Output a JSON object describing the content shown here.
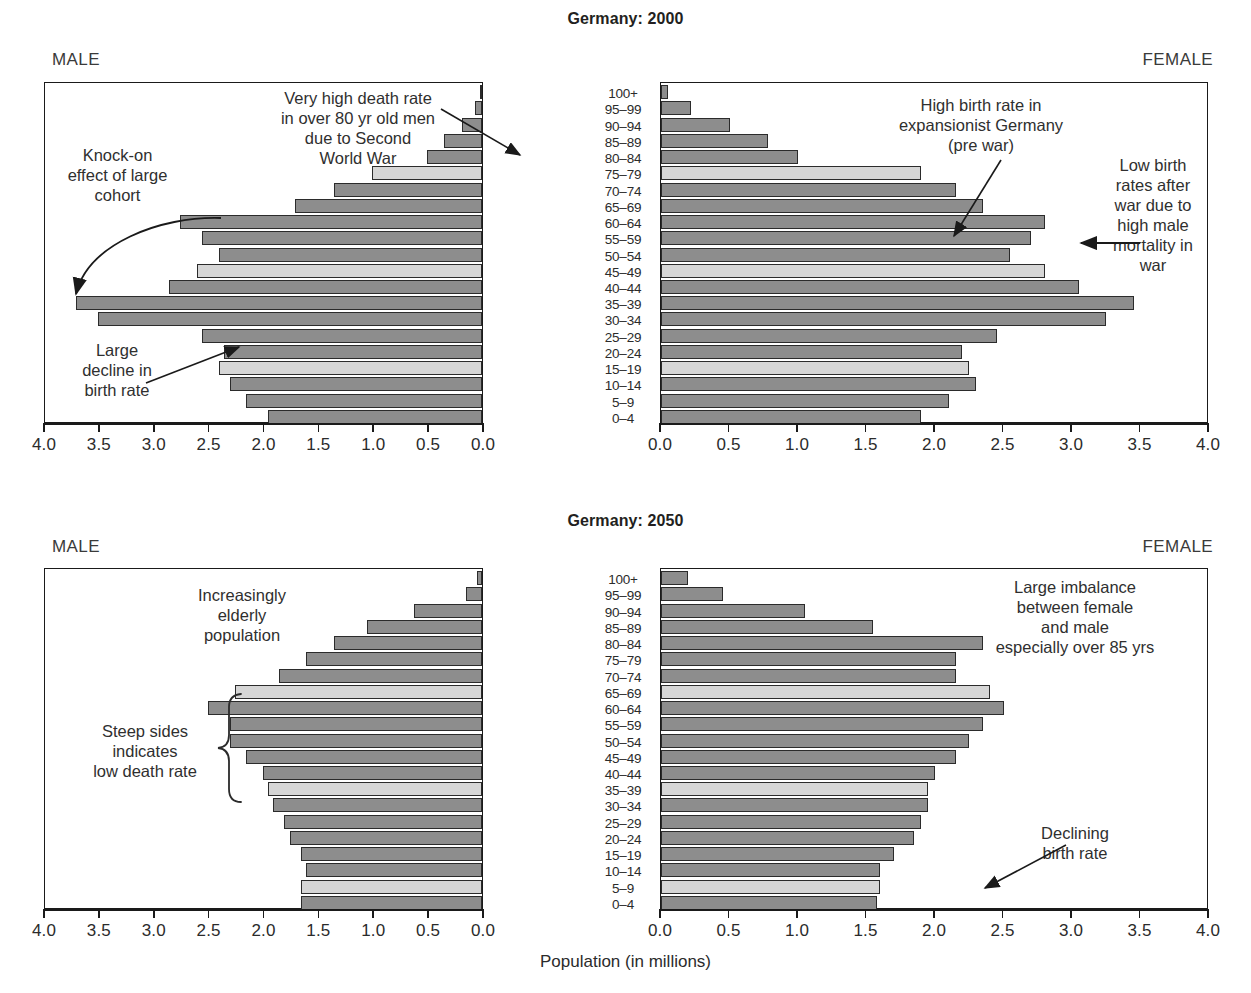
{
  "axis_title": "Population (in millions)",
  "side_labels": {
    "male": "MALE",
    "female": "FEMALE"
  },
  "tick_labels_male": [
    "4.0",
    "3.5",
    "3.0",
    "2.5",
    "2.0",
    "1.5",
    "1.0",
    "0.5",
    "0.0"
  ],
  "tick_labels_female": [
    "0.0",
    "0.5",
    "1.0",
    "1.5",
    "2.0",
    "2.5",
    "3.0",
    "3.5",
    "4.0"
  ],
  "age_groups": [
    "100+",
    "95–99",
    "90–94",
    "85–89",
    "80–84",
    "75–79",
    "70–74",
    "65–69",
    "60–64",
    "55–59",
    "50–54",
    "45–49",
    "40–44",
    "35–39",
    "30–34",
    "25–29",
    "20–24",
    "15–19",
    "10–14",
    "5–9",
    "0–4"
  ],
  "colors": {
    "bar_dark": "#8d8d8d",
    "bar_light": "#d6d6d6",
    "outline": "#2b2b2b",
    "text": "#2f2f2f"
  },
  "panels": [
    {
      "id": "2000",
      "title": "Germany: 2000",
      "annotations": [
        {
          "name": "very-high-death-rate",
          "text": "Very high death rate\nin over 80 yr old men\ndue to Second\nWorld War"
        },
        {
          "name": "knock-on-effect",
          "text": "Knock-on\neffect of large\ncohort"
        },
        {
          "name": "large-decline-birth-rate",
          "text": "Large\ndecline in\nbirth rate"
        },
        {
          "name": "high-birth-rate-expansionist",
          "text": "High birth rate in\nexpansionist Germany\n(pre war)"
        },
        {
          "name": "low-birth-rates-after-war",
          "text": "Low birth\nrates after\nwar due to\nhigh male\nmortality in\nwar"
        }
      ]
    },
    {
      "id": "2050",
      "title": "Germany: 2050",
      "annotations": [
        {
          "name": "increasingly-elderly",
          "text": "Increasingly\nelderly\npopulation"
        },
        {
          "name": "steep-sides",
          "text": "Steep sides\nindicates\nlow death rate"
        },
        {
          "name": "large-imbalance",
          "text": "Large imbalance\nbetween female\nand male\nespecially over 85 yrs"
        },
        {
          "name": "declining-birth-rate",
          "text": "Declining\nbirth rate"
        }
      ]
    }
  ],
  "chart_data": [
    {
      "type": "bar",
      "title": "Germany: 2000",
      "subtype": "population-pyramid",
      "xlabel": "Population (in millions)",
      "ylabel": "Age group",
      "xlim": [
        0,
        4.0
      ],
      "xticks": [
        0.0,
        0.5,
        1.0,
        1.5,
        2.0,
        2.5,
        3.0,
        3.5,
        4.0
      ],
      "grid": false,
      "legend": "none",
      "categories": [
        "100+",
        "95–99",
        "90–94",
        "85–89",
        "80–84",
        "75–79",
        "70–74",
        "65–69",
        "60–64",
        "55–59",
        "50–54",
        "45–49",
        "40–44",
        "35–39",
        "30–34",
        "25–29",
        "20–24",
        "15–19",
        "10–14",
        "5–9",
        "0–4"
      ],
      "series": [
        {
          "name": "MALE",
          "direction": "left",
          "values": [
            0.02,
            0.06,
            0.18,
            0.35,
            0.5,
            1.0,
            1.35,
            1.7,
            2.75,
            2.55,
            2.4,
            2.6,
            2.85,
            3.7,
            3.5,
            2.55,
            2.35,
            2.4,
            2.3,
            2.15,
            1.95
          ]
        },
        {
          "name": "FEMALE",
          "direction": "right",
          "values": [
            0.05,
            0.22,
            0.5,
            0.78,
            1.0,
            1.9,
            2.15,
            2.35,
            2.8,
            2.7,
            2.55,
            2.8,
            3.05,
            3.45,
            3.25,
            2.45,
            2.2,
            2.25,
            2.3,
            2.1,
            1.9
          ]
        }
      ]
    },
    {
      "type": "bar",
      "title": "Germany: 2050",
      "subtype": "population-pyramid",
      "xlabel": "Population (in millions)",
      "ylabel": "Age group",
      "xlim": [
        0,
        4.0
      ],
      "xticks": [
        0.0,
        0.5,
        1.0,
        1.5,
        2.0,
        2.5,
        3.0,
        3.5,
        4.0
      ],
      "grid": false,
      "legend": "none",
      "categories": [
        "100+",
        "95–99",
        "90–94",
        "85–89",
        "80–84",
        "75–79",
        "70–74",
        "65–69",
        "60–64",
        "55–59",
        "50–54",
        "45–49",
        "40–44",
        "35–39",
        "30–34",
        "25–29",
        "20–24",
        "15–19",
        "10–14",
        "5–9",
        "0–4"
      ],
      "series": [
        {
          "name": "MALE",
          "direction": "left",
          "values": [
            0.05,
            0.15,
            0.62,
            1.05,
            1.35,
            1.6,
            1.85,
            2.25,
            2.5,
            2.3,
            2.3,
            2.15,
            2.0,
            1.95,
            1.9,
            1.8,
            1.75,
            1.65,
            1.6,
            1.65,
            1.65
          ]
        },
        {
          "name": "FEMALE",
          "direction": "right",
          "values": [
            0.2,
            0.45,
            1.05,
            1.55,
            2.35,
            2.15,
            2.15,
            2.4,
            2.5,
            2.35,
            2.25,
            2.15,
            2.0,
            1.95,
            1.95,
            1.9,
            1.85,
            1.7,
            1.6,
            1.6,
            1.58
          ]
        }
      ]
    }
  ]
}
